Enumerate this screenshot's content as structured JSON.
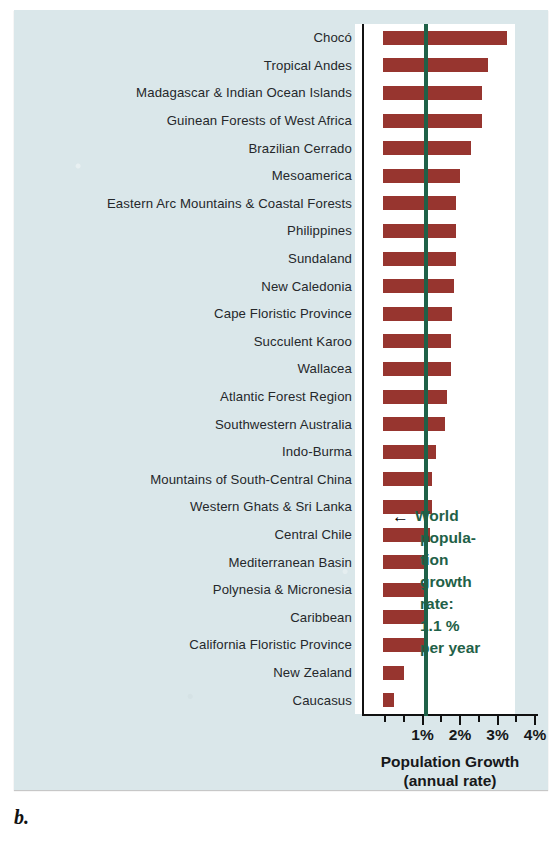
{
  "figure": {
    "letter": "b.",
    "panel_bg": "#dae7ea",
    "plot_bg": "#ffffff"
  },
  "chart_data": {
    "type": "bar",
    "orientation": "horizontal",
    "title": "",
    "xlabel": "Population Growth",
    "xlabel_sub": "(annual rate)",
    "ylabel": "",
    "xlim": [
      0,
      4
    ],
    "xunit": "%",
    "grid": false,
    "legend": "none",
    "bar_color": "#97352f",
    "reference_line": {
      "value": 1.1,
      "color": "#1f6148",
      "label_lines": [
        "World",
        "popula-",
        "tion",
        "growth",
        "rate:",
        "1.1 %",
        "per year"
      ],
      "arrow": "←"
    },
    "tick_values": [
      0,
      0.5,
      1,
      1.5,
      2,
      2.5,
      3,
      3.5,
      4
    ],
    "major_ticks": [
      1,
      2,
      3,
      4
    ],
    "tick_labels": [
      "1%",
      "2%",
      "3%",
      "4%"
    ],
    "categories": [
      "Chocó",
      "Tropical Andes",
      "Madagascar & Indian Ocean Islands",
      "Guinean Forests of West Africa",
      "Brazilian Cerrado",
      "Mesoamerica",
      "Eastern Arc Mountains & Coastal Forests",
      "Philippines",
      "Sundaland",
      "New Caledonia",
      "Cape Floristic Province",
      "Succulent Karoo",
      "Wallacea",
      "Atlantic Forest Region",
      "Southwestern Australia",
      "Indo-Burma",
      "Mountains of South-Central China",
      "Western Ghats & Sri Lanka",
      "Central Chile",
      "Mediterranean Basin",
      "Polynesia & Micronesia",
      "Caribbean",
      "California Floristic Province",
      "New Zealand",
      "Caucasus"
    ],
    "values": [
      3.3,
      2.8,
      2.65,
      2.65,
      2.35,
      2.05,
      1.95,
      1.95,
      1.95,
      1.9,
      1.85,
      1.8,
      1.8,
      1.7,
      1.65,
      1.4,
      1.3,
      1.3,
      1.25,
      1.2,
      1.2,
      1.2,
      1.15,
      0.55,
      0.3
    ]
  }
}
